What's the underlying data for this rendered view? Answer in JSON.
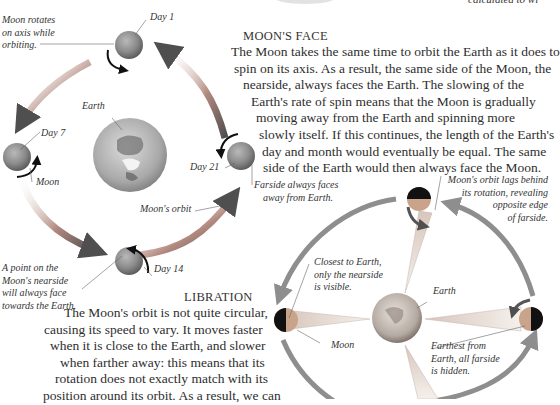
{
  "top_fragment": {
    "text": "calculated to wi"
  },
  "left_diagram": {
    "labels": {
      "moon_rotates": [
        "Moon rotates",
        "on axis while",
        "orbiting."
      ],
      "day1": "Day 1",
      "day7": "Day 7",
      "day14": "Day 14",
      "day21": "Day 21",
      "earth": "Earth",
      "moon": "Moon",
      "moons_orbit": "Moon's orbit",
      "farside": [
        "Farside always faces",
        "away from Earth."
      ],
      "point_nearside": [
        "A point on the",
        "Moon's nearside",
        "will always face",
        "towards the Earth."
      ]
    }
  },
  "moons_face": {
    "heading": "MOON'S FACE",
    "lines": [
      "The Moon takes the same time to orbit the Earth as it does to",
      "spin on its axis. As a result, the same side of the Moon, the",
      "nearside, always faces the Earth. The slowing of the",
      "Earth's rate of spin means that the Moon is gradually",
      "moving away from the Earth and spinning more",
      "slowly itself. If this continues, the length of the Earth's",
      "day and month would eventually be equal. The same",
      "side of the Earth would then always face the Moon."
    ]
  },
  "libration": {
    "heading": "LIBRATION",
    "lines": [
      "The Moon's orbit is not quite circular,",
      "causing its speed to vary. It moves faster",
      "when it is close to the Earth, and slower",
      "when farther away: this means that its",
      "rotation does not exactly match with its",
      "position around its orbit. As a result, we can"
    ]
  },
  "right_diagram": {
    "labels": {
      "orbit_lags": [
        "Moon's orbit lags behind",
        "its rotation, revealing",
        "opposite edge",
        "of farside."
      ],
      "closest": [
        "Closest to Earth,",
        "only the nearside",
        "is visible."
      ],
      "earth": "Earth",
      "moon": "Moon",
      "farthest": [
        "Farthest from",
        "Earth, all farside",
        "is hidden."
      ]
    }
  },
  "colors": {
    "arrow_dark": "#5a5a5a",
    "arrow_red": "#9b4a3c",
    "moon_gray": "#8a8a8a",
    "moon_tan": "#c9a48a",
    "moon_dark": "#111111",
    "earth_gray": "#b0b0b0"
  }
}
